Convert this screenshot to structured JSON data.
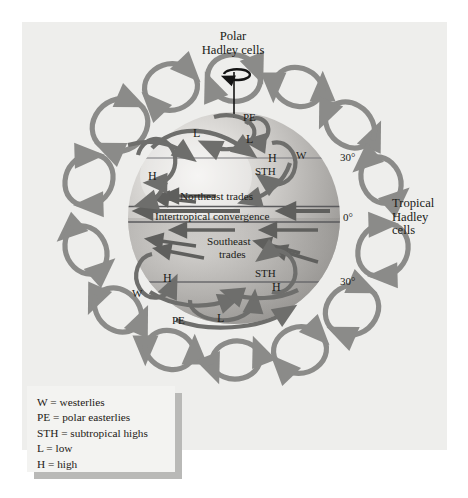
{
  "figure": {
    "title_top": {
      "line1": "Polar",
      "line2": "Hadley cells"
    },
    "title_right": {
      "line1": "Tropical",
      "line2": "Hadley",
      "line3": "cells"
    }
  },
  "latitudes": [
    {
      "name": "north-30",
      "label": "30°",
      "x": 340,
      "y": 152
    },
    {
      "name": "equator",
      "label": "0°",
      "x": 343,
      "y": 212
    },
    {
      "name": "south-30",
      "label": "30°",
      "x": 340,
      "y": 276
    }
  ],
  "globe": {
    "belt_labels": [
      {
        "name": "northeast-trades",
        "label": "Northeast trades",
        "x": 180,
        "y": 190,
        "size": 11.2
      },
      {
        "name": "intertropical-convergence",
        "label": "Intertropical convergence",
        "x": 155,
        "y": 210,
        "size": 11.2
      },
      {
        "name": "southeast-trades-1",
        "label": "Southeast",
        "x": 207,
        "y": 235,
        "size": 11.2
      },
      {
        "name": "southeast-trades-2",
        "label": "trades",
        "x": 219,
        "y": 248,
        "size": 11.2
      }
    ],
    "pressure_labels": [
      {
        "name": "pe-north",
        "label": "PE",
        "x": 243,
        "y": 112,
        "size": 11
      },
      {
        "name": "l-north-main",
        "label": "L",
        "x": 193,
        "y": 127,
        "size": 12
      },
      {
        "name": "l-north-small",
        "label": "L",
        "x": 246,
        "y": 133,
        "size": 12
      },
      {
        "name": "h-north-east",
        "label": "H",
        "x": 268,
        "y": 152,
        "size": 12
      },
      {
        "name": "w-north",
        "label": "W",
        "x": 296,
        "y": 150,
        "size": 11
      },
      {
        "name": "sth-north",
        "label": "STH",
        "x": 255,
        "y": 166,
        "size": 11
      },
      {
        "name": "h-north-west",
        "label": "H",
        "x": 148,
        "y": 170,
        "size": 12
      },
      {
        "name": "h-south-west",
        "label": "H",
        "x": 163,
        "y": 272,
        "size": 12
      },
      {
        "name": "sth-south",
        "label": "STH",
        "x": 255,
        "y": 268,
        "size": 11
      },
      {
        "name": "h-south-east",
        "label": "H",
        "x": 272,
        "y": 281,
        "size": 12
      },
      {
        "name": "w-south",
        "label": "W",
        "x": 132,
        "y": 288,
        "size": 11
      },
      {
        "name": "pe-south",
        "label": "PE",
        "x": 172,
        "y": 315,
        "size": 11
      },
      {
        "name": "l-south",
        "label": "L",
        "x": 217,
        "y": 312,
        "size": 12
      }
    ]
  },
  "legend": {
    "entries": [
      "W = westerlies",
      "PE = polar easterlies",
      "STH = subtropical highs",
      "L = low",
      "H = high"
    ]
  },
  "colors": {
    "page_background": "#ffffff",
    "panel_background": "#eeeeec",
    "outer_cell_arrow": "#8b8b89",
    "inner_cell_arrow": "#6e6e6c",
    "wind_arrow": "#5f5f5d",
    "latitude_line": "#77777a",
    "axis": "#141414",
    "text": "#201c18",
    "legend_box": "#f3f3f1",
    "legend_shadow": "#b9b9b7"
  },
  "ring_cells": [
    {
      "name": "ring-cell-1",
      "cx": 234,
      "cy": 78,
      "rx": 25,
      "ry": 21,
      "rot": 0,
      "dir": "cw"
    },
    {
      "name": "ring-cell-2",
      "cx": 171,
      "cy": 87,
      "rx": 25,
      "ry": 21,
      "rot": -22,
      "dir": "cw"
    },
    {
      "name": "ring-cell-3",
      "cx": 298,
      "cy": 87,
      "rx": 25,
      "ry": 21,
      "rot": 22,
      "dir": "ccw"
    },
    {
      "name": "ring-cell-4",
      "cx": 120,
      "cy": 125,
      "rx": 27,
      "ry": 23,
      "rot": -45,
      "dir": "cw"
    },
    {
      "name": "ring-cell-5",
      "cx": 350,
      "cy": 125,
      "rx": 27,
      "ry": 23,
      "rot": 45,
      "dir": "ccw"
    },
    {
      "name": "ring-cell-6",
      "cx": 89,
      "cy": 180,
      "rx": 25,
      "ry": 21,
      "rot": -70,
      "dir": "cw"
    },
    {
      "name": "ring-cell-7",
      "cx": 381,
      "cy": 180,
      "rx": 25,
      "ry": 21,
      "rot": 70,
      "dir": "ccw"
    },
    {
      "name": "ring-cell-8",
      "cx": 86,
      "cy": 250,
      "rx": 26,
      "ry": 22,
      "rot": -110,
      "dir": "ccw"
    },
    {
      "name": "ring-cell-9",
      "cx": 383,
      "cy": 250,
      "rx": 26,
      "ry": 22,
      "rot": 110,
      "dir": "cw"
    },
    {
      "name": "ring-cell-10",
      "cx": 118,
      "cy": 310,
      "rx": 26,
      "ry": 22,
      "rot": -135,
      "dir": "ccw"
    },
    {
      "name": "ring-cell-11",
      "cx": 352,
      "cy": 310,
      "rx": 26,
      "ry": 22,
      "rot": 135,
      "dir": "cw"
    },
    {
      "name": "ring-cell-12",
      "cx": 170,
      "cy": 350,
      "rx": 25,
      "ry": 21,
      "rot": -158,
      "dir": "ccw"
    },
    {
      "name": "ring-cell-13",
      "cx": 300,
      "cy": 350,
      "rx": 25,
      "ry": 21,
      "rot": 158,
      "dir": "cw"
    },
    {
      "name": "ring-cell-14",
      "cx": 236,
      "cy": 360,
      "rx": 25,
      "ry": 21,
      "rot": 180,
      "dir": "ccw"
    }
  ]
}
